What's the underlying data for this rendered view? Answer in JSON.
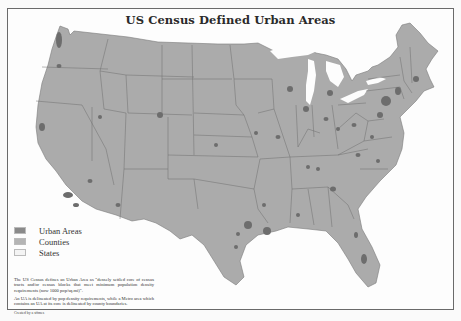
{
  "map": {
    "title": "US Census Defined Urban Areas",
    "colors": {
      "urban_areas": "#7c7c7c",
      "counties": "#ababab",
      "states": "#f4f4f4",
      "state_border": "#6e6e6e",
      "water": "#fdfdfd",
      "frame_border": "#6a6a6a"
    },
    "legend": [
      {
        "label": "Urban Areas",
        "color": "#8a8a8a"
      },
      {
        "label": "Counties",
        "color": "#b4b4b4"
      },
      {
        "label": "States",
        "color": "#f4f4f4"
      }
    ],
    "notes": [
      "The US Census defines an Urban Area as \"densely settled core of census tracts and/or census blocks that meet minimum population density requirements (now 1000 pop/sq.mi)\".",
      "An UA is delineated by pop density requirements, while a Metro area which contains an UA at its core is delineated by county boundaries."
    ],
    "credit": "Created by a sffmes"
  }
}
